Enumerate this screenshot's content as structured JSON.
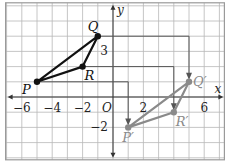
{
  "diagram": {
    "grid": {
      "xmin": -7,
      "xmax": 7,
      "ymin": -4,
      "ymax": 6
    },
    "axes": {
      "x_label": "x",
      "y_label": "y",
      "origin_label": "O"
    },
    "x_ticks": [
      {
        "value": -6,
        "label": "−6"
      },
      {
        "value": -4,
        "label": "−4"
      },
      {
        "value": -2,
        "label": "−2"
      },
      {
        "value": 2,
        "label": "2"
      },
      {
        "value": 6,
        "label": "6"
      }
    ],
    "y_ticks": [
      {
        "value": 3,
        "label": "3"
      },
      {
        "value": -2,
        "label": "−2"
      }
    ],
    "preimage": {
      "name": "PQR",
      "color": "#111111",
      "points": [
        {
          "label": "P",
          "x": -5,
          "y": 1
        },
        {
          "label": "Q",
          "x": -1,
          "y": 4
        },
        {
          "label": "R",
          "x": -2,
          "y": 2
        }
      ]
    },
    "image": {
      "name": "P'Q'R'",
      "color": "#8a8a8a",
      "points": [
        {
          "label": "P′",
          "x": 1,
          "y": -2
        },
        {
          "label": "Q′",
          "x": 5,
          "y": 1
        },
        {
          "label": "R′",
          "x": 4,
          "y": -1
        }
      ]
    },
    "translation": {
      "dx": 6,
      "dy": -3
    },
    "colors": {
      "grid": "#b8b8b8",
      "axis": "#333333",
      "arrow": "#555555",
      "frame": "#9a9a9a"
    }
  }
}
